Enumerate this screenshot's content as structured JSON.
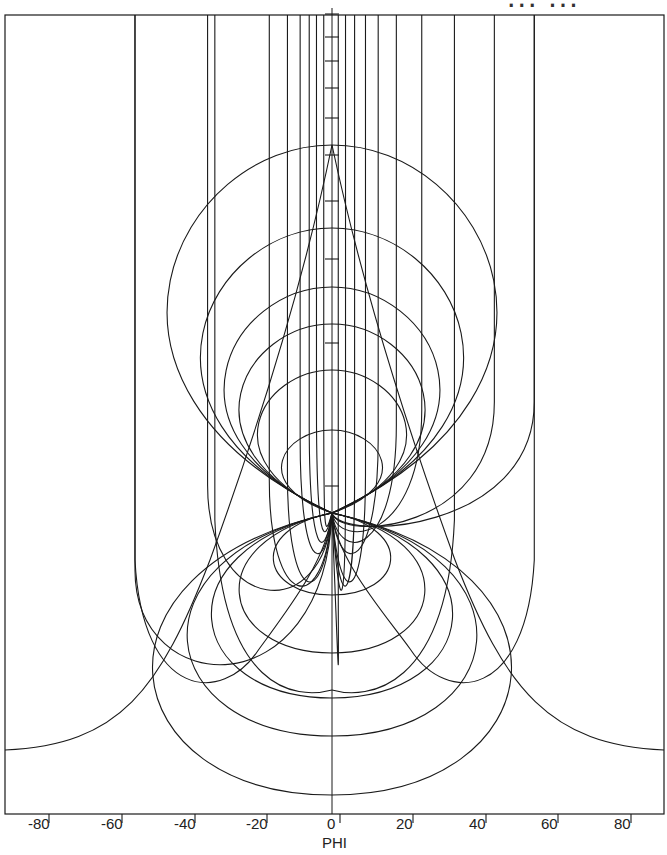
{
  "chart_data": {
    "type": "line",
    "title": "",
    "xlabel": "PHI",
    "ylabel": "",
    "xlim": [
      -85,
      92
    ],
    "x_ticks": [
      -80,
      -60,
      -40,
      -20,
      0,
      20,
      40,
      60,
      80
    ],
    "x_tick_labels": [
      "-80",
      "-60",
      "-40",
      "-20",
      "0",
      "20",
      "40",
      "60",
      "80"
    ],
    "grid": false,
    "legend": null,
    "focus_point_px": [
      332,
      513
    ],
    "central_axis_ticks_px_y": [
      14,
      37,
      61,
      88,
      118,
      155,
      201,
      259,
      343,
      486
    ],
    "field_lines": {
      "description": "Vertical lines from top frame bending into U-shapes converging at focus",
      "left_x_phi": [
        -54,
        -34,
        -17,
        -12,
        -8.5,
        -6,
        -4,
        -2
      ],
      "right_x_phi": [
        2,
        4,
        6.5,
        9.5,
        13,
        18,
        25,
        45,
        56
      ],
      "bottom_y_px": [
        690,
        605,
        600,
        595,
        560,
        545,
        530,
        522
      ]
    },
    "upper_arches": {
      "description": "Closed arch curves above focus (peaks on PHI=0)",
      "peak_y_px": [
        145,
        228,
        287,
        324,
        370,
        430
      ]
    },
    "lower_loops": {
      "description": "Closed loops below focus (bottoms on PHI=0)",
      "bottom_y_px": [
        595,
        653,
        698,
        736,
        795
      ]
    },
    "outer_curves": {
      "description": "Large outer curves meeting frame edges",
      "edge_y_px": 750
    }
  },
  "header": {
    "clipped_text": "... ..."
  },
  "axis": {
    "xlabel": "PHI",
    "ticks": [
      {
        "label": "-80",
        "x": 40
      },
      {
        "label": "-60",
        "x": 113
      },
      {
        "label": "-40",
        "x": 186
      },
      {
        "label": "-20",
        "x": 258
      },
      {
        "label": "0",
        "x": 331
      },
      {
        "label": "20",
        "x": 404
      },
      {
        "label": "40",
        "x": 477
      },
      {
        "label": "60",
        "x": 549
      },
      {
        "label": "80",
        "x": 622
      }
    ]
  },
  "colors": {
    "line": "#1a1a1a",
    "background": "#ffffff"
  }
}
